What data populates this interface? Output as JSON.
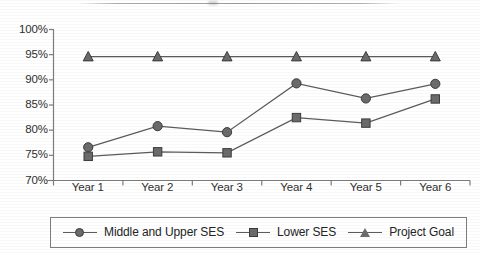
{
  "chart_data": {
    "type": "line",
    "title": "",
    "xlabel": "",
    "ylabel": "",
    "categories": [
      "Year 1",
      "Year 2",
      "Year 3",
      "Year 4",
      "Year 5",
      "Year 6"
    ],
    "ylim": [
      70,
      100
    ],
    "ytick_labels": [
      "100%",
      "95%",
      "90%",
      "85%",
      "80%",
      "75%",
      "70%"
    ],
    "ytick_values": [
      100,
      95,
      90,
      85,
      80,
      75,
      70
    ],
    "ytick_format": "percent",
    "grid": false,
    "legend_position": "bottom",
    "series": [
      {
        "name": "Middle and Upper SES",
        "marker": "circle",
        "color": "#6b6b6b",
        "values": [
          76.6,
          80.8,
          79.6,
          89.3,
          86.3,
          89.2
        ]
      },
      {
        "name": "Lower SES",
        "marker": "square",
        "color": "#6b6b6b",
        "values": [
          74.8,
          75.7,
          75.5,
          82.5,
          81.4,
          86.2
        ]
      },
      {
        "name": "Project Goal",
        "marker": "triangle",
        "color": "#6b6b6b",
        "values": [
          94.6,
          94.6,
          94.6,
          94.6,
          94.6,
          94.6
        ]
      }
    ]
  },
  "axis": {
    "y_labels": [
      "100%",
      "95%",
      "90%",
      "85%",
      "80%",
      "75%",
      "70%"
    ],
    "x_labels": [
      "Year 1",
      "Year 2",
      "Year 3",
      "Year 4",
      "Year 5",
      "Year 6"
    ]
  },
  "legend": {
    "items": [
      {
        "label": "Middle and Upper SES",
        "marker": "circle-marker-icon"
      },
      {
        "label": "Lower SES",
        "marker": "square-marker-icon"
      },
      {
        "label": "Project Goal",
        "marker": "triangle-marker-icon"
      }
    ]
  },
  "colors": {
    "series_fill": "#6b6b6b",
    "series_stroke": "#3c3c3c",
    "axis": "#7d7d7d",
    "text": "#2b2b2b",
    "background": "#ffffff"
  }
}
